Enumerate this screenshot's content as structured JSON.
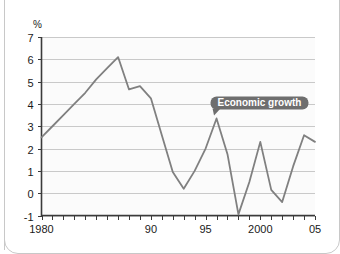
{
  "chart_data": {
    "type": "line",
    "title": "",
    "xlabel": "",
    "ylabel": "%",
    "ylim": [
      -1,
      7
    ],
    "xlim": [
      1980,
      2005
    ],
    "grid": true,
    "legend_position": "inline-annotation",
    "y_ticks": [
      "7",
      "6",
      "5",
      "4",
      "3",
      "2",
      "1",
      "0",
      "-1"
    ],
    "y_tick_values": [
      7,
      6,
      5,
      4,
      3,
      2,
      1,
      0,
      -1
    ],
    "x_tick_labels": [
      "1980",
      "90",
      "95",
      "2000",
      "05"
    ],
    "x_tick_values": [
      1980,
      1990,
      1995,
      2000,
      2005
    ],
    "annotations": [
      {
        "text": "Economic growth",
        "anchor_x": 1996,
        "anchor_y": 3.35
      }
    ],
    "series": [
      {
        "name": "Economic growth",
        "color": "#808080",
        "x": [
          1980,
          1981,
          1982,
          1983,
          1984,
          1985,
          1986,
          1987,
          1988,
          1989,
          1990,
          1991,
          1992,
          1993,
          1994,
          1995,
          1996,
          1997,
          1998,
          1999,
          2000,
          2001,
          2002,
          2003,
          2004,
          2005
        ],
        "values": [
          2.5,
          3.0,
          3.5,
          4.0,
          4.5,
          5.1,
          5.6,
          6.1,
          4.65,
          4.8,
          4.25,
          2.6,
          0.95,
          0.2,
          1.0,
          2.0,
          3.35,
          1.75,
          -0.95,
          0.5,
          2.3,
          0.15,
          -0.4,
          1.2,
          2.6,
          2.3
        ]
      }
    ]
  },
  "axis": {
    "unit_label": "%"
  },
  "callout": {
    "label": "Economic growth",
    "background": "#6e6e6e",
    "text_color": "#ffffff"
  },
  "colors": {
    "line": "#808080",
    "grid": "#c9c9c9",
    "axis": "#3a3a3a",
    "plot_background": "#fbfbfb",
    "frame_border": "#c8c8c8"
  }
}
